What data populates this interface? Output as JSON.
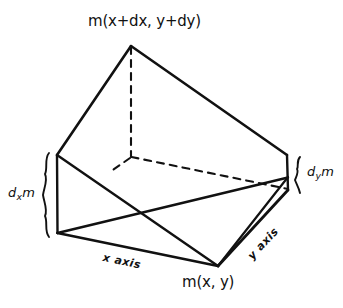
{
  "figure": {
    "title_text": "",
    "background_color": "#ffffff",
    "ink_color": "#111111",
    "labels": {
      "top_vertex": "m(x+dx, y+dy)",
      "bottom_vertex": "m(x, y)",
      "left_brace_prefix": "d",
      "left_brace_sub": "x",
      "left_brace_suffix": "m",
      "right_brace_prefix": "d",
      "right_brace_sub": "y",
      "right_brace_suffix": "m",
      "x_axis": "x axis",
      "y_axis": "y axis"
    },
    "geometry": {
      "description": "Hand-drawn 3D parallelepiped (infinitesimal mass element) with hidden edges dashed",
      "vertices": {
        "top_apex": [
          131,
          46
        ],
        "left_top": [
          57,
          155
        ],
        "left_bottom": [
          57,
          233
        ],
        "right_top": [
          287,
          155
        ],
        "right_bottom": [
          288,
          190
        ],
        "front_bottom": [
          218,
          266
        ],
        "hidden_back": [
          131,
          157
        ],
        "mid_cross": [
          115,
          175
        ]
      },
      "solid_edges": [
        [
          [
            131,
            46
          ],
          [
            57,
            155
          ]
        ],
        [
          [
            131,
            46
          ],
          [
            287,
            155
          ]
        ],
        [
          [
            57,
            155
          ],
          [
            57,
            233
          ]
        ],
        [
          [
            287,
            155
          ],
          [
            288,
            190
          ]
        ],
        [
          [
            57,
            233
          ],
          [
            218,
            266
          ]
        ],
        [
          [
            218,
            266
          ],
          [
            288,
            190
          ]
        ],
        [
          [
            218,
            266
          ],
          [
            288,
            178
          ]
        ],
        [
          [
            57,
            155
          ],
          [
            218,
            266
          ]
        ],
        [
          [
            57,
            233
          ],
          [
            288,
            178
          ]
        ]
      ],
      "dashed_edges": [
        [
          [
            131,
            46
          ],
          [
            131,
            157
          ]
        ],
        [
          [
            131,
            157
          ],
          [
            288,
            190
          ]
        ],
        [
          [
            131,
            157
          ],
          [
            108,
            172
          ]
        ]
      ],
      "braces": [
        {
          "name": "left",
          "x": 45,
          "y_top": 153,
          "y_bottom": 237
        },
        {
          "name": "right",
          "x": 297,
          "y_top": 157,
          "y_bottom": 193
        }
      ]
    }
  }
}
